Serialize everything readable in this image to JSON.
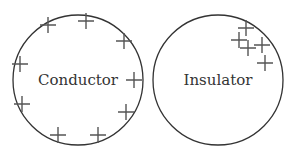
{
  "diagram": {
    "conductor": {
      "label": "Conductor",
      "center": [
        78,
        80
      ],
      "radius": 65,
      "charges": [
        [
          48,
          25
        ],
        [
          86,
          21
        ],
        [
          124,
          41
        ],
        [
          20,
          64
        ],
        [
          134,
          80
        ],
        [
          22,
          104
        ],
        [
          126,
          112
        ],
        [
          58,
          135
        ],
        [
          98,
          135
        ]
      ],
      "charge_sign": "+"
    },
    "insulator": {
      "label": "Insulator",
      "center": [
        218,
        80
      ],
      "radius": 65,
      "charges": [
        [
          246,
          28
        ],
        [
          239,
          40
        ],
        [
          248,
          48
        ],
        [
          262,
          45
        ],
        [
          265,
          63
        ]
      ],
      "charge_sign": "+"
    },
    "colors": {
      "outline": "#333333",
      "charge": "#555555",
      "text": "#333333"
    }
  }
}
